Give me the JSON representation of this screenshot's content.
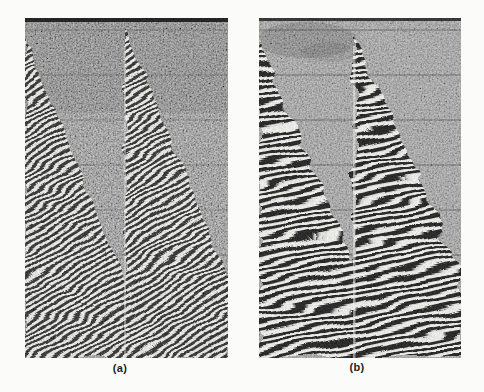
{
  "figure": {
    "panels": [
      {
        "label": "(a)"
      },
      {
        "label": "(b)"
      }
    ],
    "colors": {
      "page_bg": "#fbfbfa",
      "panel_a_bg": "#818181",
      "panel_b_bg": "#9c9c9c",
      "stripe_ink": "#0c0c0c",
      "stripe_paper": "#f4f4f0",
      "label_ink": "#1e1e1e"
    }
  }
}
